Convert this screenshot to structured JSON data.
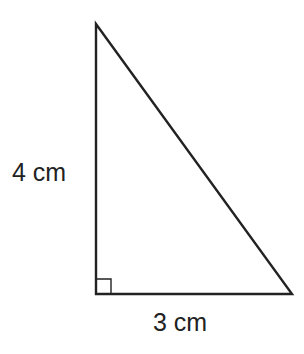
{
  "diagram": {
    "type": "right-triangle",
    "vertices": {
      "top": [
        96,
        24
      ],
      "right_angle": [
        96,
        294
      ],
      "bottom_right": [
        292,
        294
      ]
    },
    "right_angle_marker_size": 15,
    "stroke_color": "#222222",
    "labels": {
      "height": "4 cm",
      "base": "3 cm"
    }
  }
}
